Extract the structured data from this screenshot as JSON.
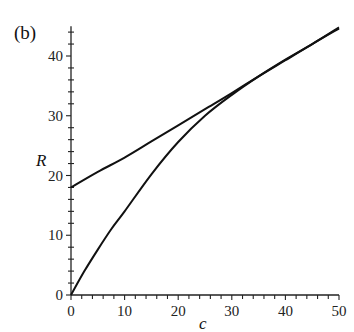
{
  "chart_data": {
    "type": "line",
    "title": "",
    "panel_label": "(b)",
    "xlabel": "c",
    "ylabel": "R",
    "xlim": [
      0,
      50
    ],
    "ylim": [
      0,
      45
    ],
    "xticks": [
      0,
      10,
      20,
      30,
      40,
      50
    ],
    "yticks": [
      0,
      10,
      20,
      30,
      40
    ],
    "x_minor_step": 2,
    "y_minor_step": 2,
    "grid": false,
    "legend": null,
    "series": [
      {
        "name": "upper curve (R(0)=18)",
        "x": [
          0,
          5,
          10,
          15,
          20,
          25,
          30,
          35,
          40,
          45,
          50
        ],
        "y": [
          18,
          20.6,
          23.0,
          25.7,
          28.4,
          31.1,
          33.8,
          36.6,
          39.3,
          42.0,
          44.6
        ]
      },
      {
        "name": "lower curve (R(0)=0)",
        "x": [
          0,
          2.5,
          5,
          7.5,
          10,
          15,
          20,
          25,
          30,
          35,
          40,
          45,
          50
        ],
        "y": [
          0,
          4.0,
          7.6,
          11.0,
          14.0,
          20.2,
          25.6,
          30.0,
          33.5,
          36.6,
          39.4,
          42.0,
          44.8
        ]
      }
    ]
  }
}
